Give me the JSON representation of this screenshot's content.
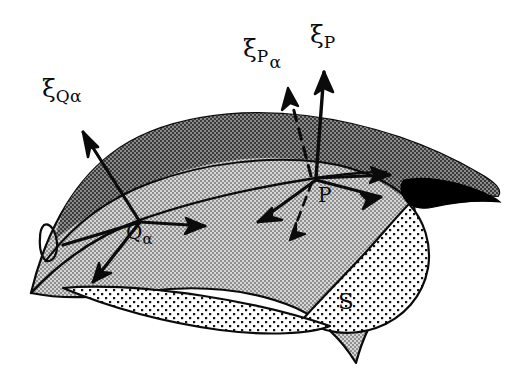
{
  "figure": {
    "type": "geometry-diagram",
    "background_color": "#ffffff",
    "ink_color": "#0b0b0b"
  },
  "surface": {
    "name_label": "S",
    "fill_light": "#a8a8a8",
    "fill_dark": "#6f6f6f",
    "fill_black": "#000000",
    "underside_fill": "#ffffff",
    "underside_dot_color": "#111111",
    "outline_color": "#0b0b0b"
  },
  "labels": {
    "xi_q_alpha": {
      "symbol": "ξ",
      "sub": "Q",
      "sub2": "α"
    },
    "xi_p_alpha": {
      "symbol": "ξ",
      "sub": "P",
      "sub2": "α"
    },
    "xi_p": {
      "symbol": "ξ",
      "sub": "P",
      "sub2": ""
    },
    "point_p": {
      "text": "P"
    },
    "point_q": {
      "base": "Q",
      "sub": "α"
    },
    "surface_s": {
      "text": "S"
    }
  },
  "vectors": {
    "at_p": [
      {
        "name": "normal-vector-p",
        "style": "solid",
        "direction": "up"
      },
      {
        "name": "normal-vector-p-alpha",
        "style": "dashed",
        "direction": "up-left"
      },
      {
        "name": "tangent-vector-p-right-upper",
        "style": "solid",
        "direction": "right"
      },
      {
        "name": "tangent-vector-p-right-lower",
        "style": "solid",
        "direction": "right-down"
      },
      {
        "name": "tangent-vector-p-down-left",
        "style": "solid",
        "direction": "down-left"
      },
      {
        "name": "tangent-vector-p-dashed-down",
        "style": "dashed",
        "direction": "down"
      }
    ],
    "at_q": [
      {
        "name": "normal-vector-q-alpha",
        "style": "solid",
        "direction": "up-left"
      },
      {
        "name": "tangent-vector-q-right",
        "style": "solid",
        "direction": "right"
      },
      {
        "name": "tangent-vector-q-down-left",
        "style": "solid",
        "direction": "down-left"
      },
      {
        "name": "tangent-line-q-left",
        "style": "solid",
        "direction": "left"
      }
    ]
  }
}
